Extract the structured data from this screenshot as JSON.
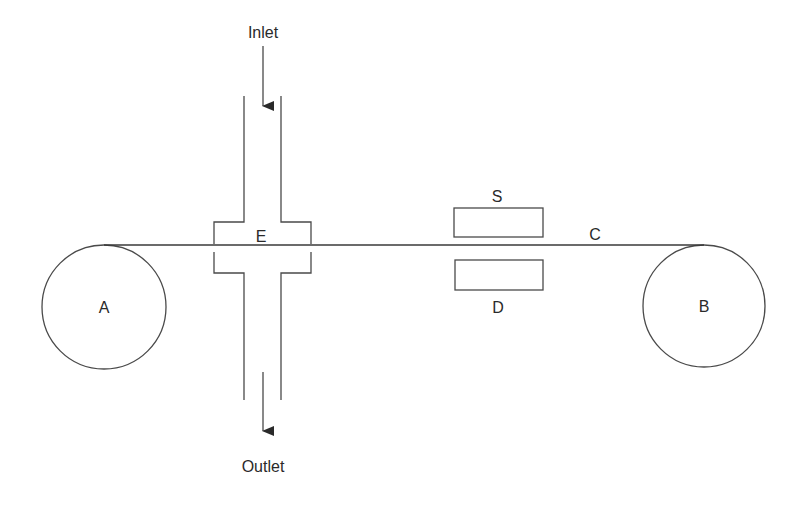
{
  "diagram": {
    "labels": {
      "inlet": "Inlet",
      "outlet": "Outlet",
      "chamber": "E",
      "tape": "C",
      "source": "S",
      "detector": "D",
      "supply_roller": "A",
      "takeup_roller": "B"
    },
    "colors": {
      "line": "#4a4a4a",
      "text": "#2a2a2a",
      "background": "#ffffff"
    }
  }
}
